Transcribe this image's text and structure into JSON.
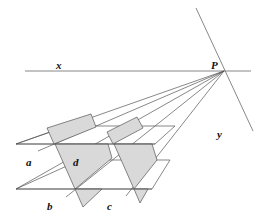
{
  "diagram": {
    "labels": {
      "x": "x",
      "P": "P",
      "y": "y",
      "a": "a",
      "b": "b",
      "c": "c",
      "d": "d"
    },
    "colors": {
      "line": "#555555",
      "shade": "#d9d9d9",
      "background": "#ffffff"
    }
  }
}
